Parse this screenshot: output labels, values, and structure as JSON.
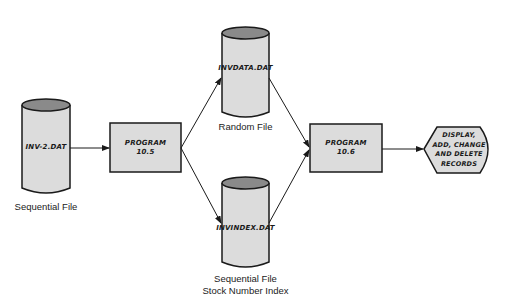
{
  "diagram": {
    "colors": {
      "fill": "#dcdcdc",
      "cylinder_top": "#8a8a8a",
      "stroke": "#1a1a1a",
      "background": "#ffffff"
    },
    "nodes": {
      "inv2": {
        "label": "INV-2.DAT",
        "caption": "Sequential File",
        "shape": "cylinder"
      },
      "prog105": {
        "label_line1": "PROGRAM",
        "label_line2": "10.5",
        "shape": "process-box"
      },
      "invdata": {
        "label": "INVDATA.DAT",
        "caption": "Random File",
        "shape": "cylinder"
      },
      "invindex": {
        "label": "INVINDEX.DAT",
        "caption_line1": "Sequential File",
        "caption_line2": "Stock Number Index",
        "shape": "cylinder"
      },
      "prog106": {
        "label_line1": "PROGRAM",
        "label_line2": "10.6",
        "shape": "process-box"
      },
      "display": {
        "line1": "DISPLAY,",
        "line2": "ADD, CHANGE",
        "line3": "AND DELETE",
        "line4": "RECORDS",
        "shape": "display"
      }
    },
    "edges": [
      {
        "from": "INV-2.DAT",
        "to": "PROGRAM 10.5"
      },
      {
        "from": "PROGRAM 10.5",
        "to": "INVDATA.DAT"
      },
      {
        "from": "PROGRAM 10.5",
        "to": "INVINDEX.DAT"
      },
      {
        "from": "INVDATA.DAT",
        "to": "PROGRAM 10.6"
      },
      {
        "from": "INVINDEX.DAT",
        "to": "PROGRAM 10.6"
      },
      {
        "from": "PROGRAM 10.6",
        "to": "DISPLAY, ADD, CHANGE AND DELETE RECORDS"
      }
    ]
  }
}
